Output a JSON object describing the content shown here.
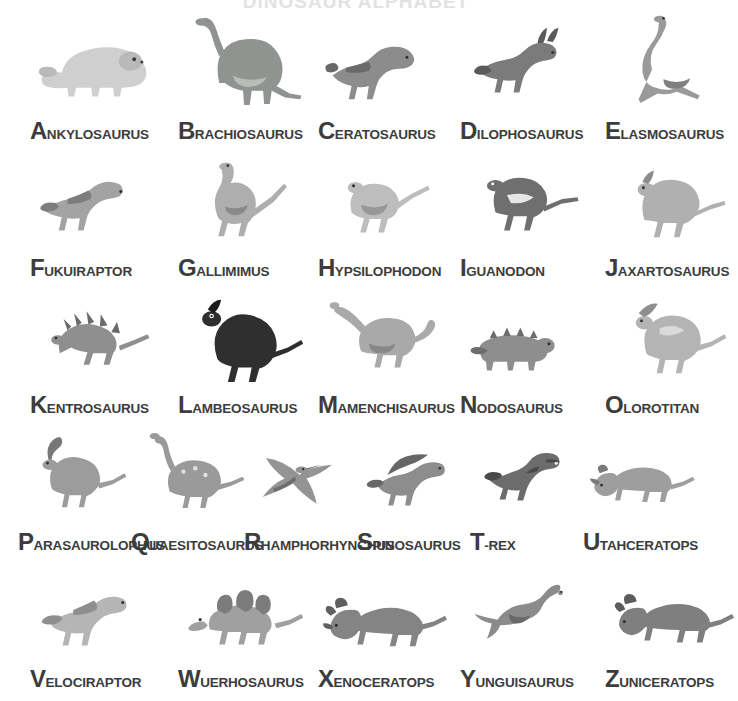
{
  "title": "DINOSAUR ALPHABET",
  "background_color": "#ffffff",
  "text_color": "#3c3c3c",
  "layout": {
    "columns": 5,
    "rows": 5,
    "column_x": [
      30,
      178,
      318,
      460,
      605
    ]
  },
  "entries": [
    {
      "letter": "A",
      "rest": "NKYLOSAURUS",
      "name": "Ankylosaurus",
      "icon": "ankylosaurus-icon",
      "tone": "#cfcfcf",
      "shade": "#b9b9b9",
      "row": 0,
      "col": 0
    },
    {
      "letter": "B",
      "rest": "RACHIOSAURUS",
      "name": "Brachiosaurus",
      "icon": "brachiosaurus-icon",
      "tone": "#8f9490",
      "shade": "#b9bdb8",
      "row": 0,
      "col": 1
    },
    {
      "letter": "C",
      "rest": "ERATOSAURUS",
      "name": "Ceratosaurus",
      "icon": "ceratosaurus-icon",
      "tone": "#8c8c8c",
      "shade": "#6a6a6a",
      "row": 0,
      "col": 2
    },
    {
      "letter": "D",
      "rest": "ILOPHOSAURUS",
      "name": "Dilophosaurus",
      "icon": "dilophosaurus-icon",
      "tone": "#7b7b7b",
      "shade": "#5a5a5a",
      "row": 0,
      "col": 3
    },
    {
      "letter": "E",
      "rest": "LASMOSAURUS",
      "name": "Elasmosaurus",
      "icon": "elasmosaurus-icon",
      "tone": "#9a9a9a",
      "shade": "#808080",
      "row": 0,
      "col": 4
    },
    {
      "letter": "F",
      "rest": "UKUIRAPTOR",
      "name": "Fukuiraptor",
      "icon": "fukuiraptor-icon",
      "tone": "#a3a3a3",
      "shade": "#7d7d7d",
      "row": 1,
      "col": 0
    },
    {
      "letter": "G",
      "rest": "ALLIMIMUS",
      "name": "Gallimimus",
      "icon": "gallimimus-icon",
      "tone": "#aeaeae",
      "shade": "#8a8a8a",
      "row": 1,
      "col": 1
    },
    {
      "letter": "H",
      "rest": "YPSILOPHODON",
      "name": "Hypsilophodon",
      "icon": "hypsilophodon-icon",
      "tone": "#bdbdbd",
      "shade": "#979797",
      "row": 1,
      "col": 2
    },
    {
      "letter": "I",
      "rest": "GUANODON",
      "name": "Iguanodon",
      "icon": "iguanodon-icon",
      "tone": "#6f6f6f",
      "shade": "#4e4e4e",
      "row": 1,
      "col": 3
    },
    {
      "letter": "J",
      "rest": "AXARTOSAURUS",
      "name": "Jaxartosaurus",
      "icon": "jaxartosaurus-icon",
      "tone": "#b0b0b0",
      "shade": "#8c8c8c",
      "row": 1,
      "col": 4
    },
    {
      "letter": "K",
      "rest": "ENTROSAURUS",
      "name": "Kentrosaurus",
      "icon": "kentrosaurus-icon",
      "tone": "#8f8f8f",
      "shade": "#6b6b6b",
      "row": 2,
      "col": 0
    },
    {
      "letter": "L",
      "rest": "AMBEOSAURUS",
      "name": "Lambeosaurus",
      "icon": "lambeosaurus-icon",
      "tone": "#2f2f2f",
      "shade": "#1c1c1c",
      "row": 2,
      "col": 1
    },
    {
      "letter": "M",
      "rest": "AMENCHISAURUS",
      "name": "Mamenchisaurus",
      "icon": "mamenchisaurus-icon",
      "tone": "#a9a9a9",
      "shade": "#888888",
      "row": 2,
      "col": 2
    },
    {
      "letter": "N",
      "rest": "ODOSAURUS",
      "name": "Nodosaurus",
      "icon": "nodosaurus-icon",
      "tone": "#8e8e8e",
      "shade": "#6d6d6d",
      "row": 2,
      "col": 3
    },
    {
      "letter": "O",
      "rest": "LOROTITAN",
      "name": "Olorotitan",
      "icon": "olorotitan-icon",
      "tone": "#b4b4b4",
      "shade": "#8f8f8f",
      "row": 2,
      "col": 4
    },
    {
      "letter": "P",
      "rest": "ARASAUROLOPHUS",
      "name": "Parasaurolophus",
      "icon": "parasaurolophus-icon",
      "tone": "#9c9c9c",
      "shade": "#777777",
      "row": 3,
      "col": 0
    },
    {
      "letter": "Q",
      "rest": "UAESITOSAURUS",
      "name": "Quaesitosaurus",
      "icon": "quaesitosaurus-icon",
      "tone": "#9a9a9a",
      "shade": "#747474",
      "row": 3,
      "col": 1
    },
    {
      "letter": "R",
      "rest": "HAMPHORHYNCHUS",
      "name": "Rhamphorhynchus",
      "icon": "rhamphorhynchus-icon",
      "tone": "#949494",
      "shade": "#6e6e6e",
      "row": 3,
      "col": 2
    },
    {
      "letter": "S",
      "rest": "PINOSAURUS",
      "name": "Spinosaurus",
      "icon": "spinosaurus-icon",
      "tone": "#8d8d8d",
      "shade": "#676767",
      "row": 3,
      "col": 3
    },
    {
      "letter": "T",
      "rest": "-REX",
      "name": "T-Rex",
      "icon": "t-rex-icon",
      "tone": "#6c6c6c",
      "shade": "#4a4a4a",
      "row": 3,
      "col": 4
    },
    {
      "letter": "U",
      "rest": "TAHCERATOPS",
      "name": "Utahceratops",
      "icon": "utahceratops-icon",
      "tone": "#9e9e9e",
      "shade": "#7a7a7a",
      "row": 3,
      "col": 5
    },
    {
      "letter": "V",
      "rest": "ELOCIRAPTOR",
      "name": "Velociraptor",
      "icon": "velociraptor-icon",
      "tone": "#b5b5b5",
      "shade": "#8e8e8e",
      "row": 4,
      "col": 0
    },
    {
      "letter": "W",
      "rest": "UERHOSAURUS",
      "name": "Wuerhosaurus",
      "icon": "wuerhosaurus-icon",
      "tone": "#a0a0a0",
      "shade": "#7c7c7c",
      "row": 4,
      "col": 1
    },
    {
      "letter": "X",
      "rest": "ENOCERATOPS",
      "name": "Xenoceratops",
      "icon": "xenoceratops-icon",
      "tone": "#848484",
      "shade": "#606060",
      "row": 4,
      "col": 2
    },
    {
      "letter": "Y",
      "rest": "UNGUISAURUS",
      "name": "Yunguisaurus",
      "icon": "yunguisaurus-icon",
      "tone": "#8b8b8b",
      "shade": "#6a6a6a",
      "row": 4,
      "col": 3
    },
    {
      "letter": "Z",
      "rest": "UNICERATOPS",
      "name": "Zuniceratops",
      "icon": "zuniceratops-icon",
      "tone": "#7f7f7f",
      "shade": "#5c5c5c",
      "row": 4,
      "col": 4
    }
  ]
}
